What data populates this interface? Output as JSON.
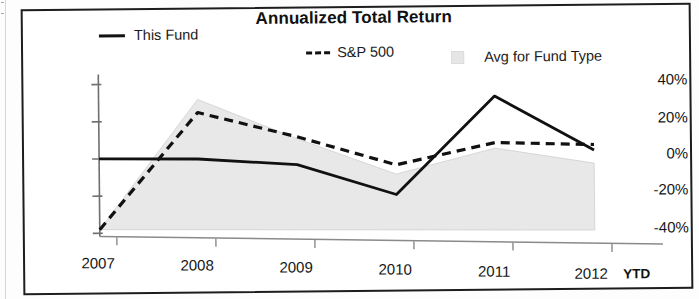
{
  "chart_data": {
    "type": "line",
    "title": "Annualized Total Return",
    "xlabel": "",
    "ylabel": "",
    "x": [
      "2007",
      "2008",
      "2009",
      "2010",
      "2011",
      "2012"
    ],
    "x_last_suffix": "YTD",
    "ylim": [
      -40,
      40
    ],
    "ytick_labels": [
      "40%",
      "20%",
      "0%",
      "-20%",
      "-40%"
    ],
    "ytick_values": [
      40,
      20,
      0,
      -20,
      -40
    ],
    "grid": false,
    "legend_position": "top",
    "series": [
      {
        "name": "This Fund",
        "style": "solid",
        "color": "#111111",
        "values": [
          0,
          0,
          -3,
          -19,
          34,
          5
        ]
      },
      {
        "name": "S&P 500",
        "style": "dashed",
        "color": "#111111",
        "values": [
          -38,
          25,
          12,
          -3,
          9,
          8
        ]
      },
      {
        "name": "Avg for Fund Type",
        "style": "band",
        "color": "#e6e6e6",
        "upper": [
          -38,
          32,
          11,
          -8,
          6,
          -2
        ],
        "lower": [
          -38,
          -38,
          -38,
          -38,
          -38,
          -38
        ]
      }
    ],
    "band_note": "Avg for Fund Type is drawn as a shaded range region"
  },
  "chart": {
    "title": "Annualized Total Return",
    "legend": [
      {
        "label": "This Fund",
        "swatch": "solid-line-swatch"
      },
      {
        "label": "S&P 500",
        "swatch": "dashed-line-swatch"
      },
      {
        "label": "Avg for Fund Type",
        "swatch": "gray-square-swatch"
      }
    ],
    "y_axis": {
      "ticks": [
        "40%",
        "20%",
        "0%",
        "-20%",
        "-40%"
      ]
    },
    "x_axis": {
      "ticks": [
        "2007",
        "2008",
        "2009",
        "2010",
        "2011",
        "2012"
      ],
      "suffix": "YTD"
    }
  }
}
